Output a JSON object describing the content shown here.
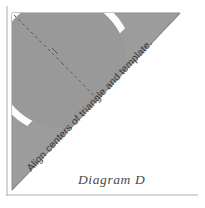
{
  "figure": {
    "caption": "Diagram D",
    "instruction": "Align centers of triangle and template.",
    "colors": {
      "triangle_fill": "#9c9c9c",
      "triangle_edge": "#8a8a8a",
      "template_band": "#fdfdfd",
      "inner_fill": "#9a9a9a",
      "dashed_line": "#5a5a5a",
      "frame_border": "#b0b0b0",
      "text": "#3a3a3a",
      "caption_color": "#4a4a4a",
      "background": "#ffffff"
    },
    "geometry": {
      "triangle_points": "12,13 180,13 12,190",
      "template_center_x": 62,
      "template_center_y": 63,
      "template_outer_radius": 72,
      "template_inner_radius": 65,
      "template_rotation_deg": -45,
      "dashed_line_1": "14,15 62,63",
      "dashed_line_2": "62,63 108,110"
    },
    "labels": {
      "triangle": "right-triangle",
      "template": "semicircular-template",
      "center_marks": "center-alignment-dashed-lines"
    }
  }
}
